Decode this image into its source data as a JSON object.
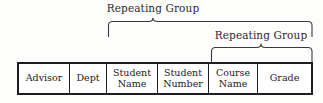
{
  "diagram": {
    "type": "database-table-structure",
    "background_color": "#fdfdfc",
    "line_color": "#1d1d1d",
    "text_color": "#1a1a1a"
  },
  "annotations": [
    {
      "id": "outer",
      "label": "Repeating Group",
      "spans_columns": [
        "Student Name",
        "Student Number",
        "Course Name",
        "Grade"
      ],
      "brace_left_x": 108,
      "brace_right_x": 312,
      "brace_tip_x": 153
    },
    {
      "id": "inner",
      "label": "Repeating Group",
      "spans_columns": [
        "Course Name",
        "Grade"
      ],
      "brace_left_x": 211,
      "brace_right_x": 312,
      "brace_tip_x": 261
    }
  ],
  "table": {
    "columns": [
      {
        "label": "Advisor",
        "text": "Advisor"
      },
      {
        "label": "Dept",
        "text": "Dept"
      },
      {
        "label": "Student Name",
        "text": "Student\nName"
      },
      {
        "label": "Student Number",
        "text": "Student\nNumber"
      },
      {
        "label": "Course Name",
        "text": "Course\nName"
      },
      {
        "label": "Grade",
        "text": "Grade"
      }
    ]
  }
}
